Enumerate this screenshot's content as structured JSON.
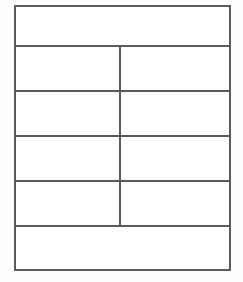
{
  "document": {
    "kind": "blank-table-form",
    "background_color": "#fdfdfd",
    "table_background_color": "#ffffff",
    "line_color": "#5b5b5b"
  },
  "table": {
    "row_count": 6,
    "column_count": 2,
    "rows": [
      {
        "layout": "full-width",
        "cells": [
          {
            "text": ""
          }
        ]
      },
      {
        "layout": "two-column",
        "cells": [
          {
            "text": ""
          },
          {
            "text": ""
          }
        ]
      },
      {
        "layout": "two-column",
        "cells": [
          {
            "text": ""
          },
          {
            "text": ""
          }
        ]
      },
      {
        "layout": "two-column",
        "cells": [
          {
            "text": ""
          },
          {
            "text": ""
          }
        ]
      },
      {
        "layout": "two-column",
        "cells": [
          {
            "text": ""
          },
          {
            "text": ""
          }
        ]
      },
      {
        "layout": "full-width",
        "cells": [
          {
            "text": ""
          }
        ]
      }
    ]
  }
}
